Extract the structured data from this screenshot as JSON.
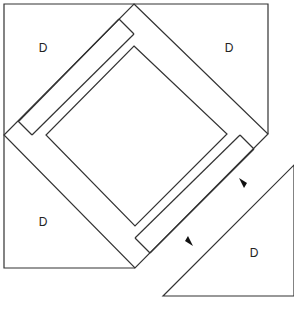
{
  "diagram": {
    "piece_labels": {
      "top_left": "D",
      "top_right": "D",
      "bottom_left": "D",
      "detached": "D"
    },
    "arrows": [
      "alignment-arrow-upper",
      "alignment-arrow-lower"
    ],
    "colors": {
      "line": "#333333",
      "background": "#ffffff",
      "arrow": "#111111"
    }
  }
}
